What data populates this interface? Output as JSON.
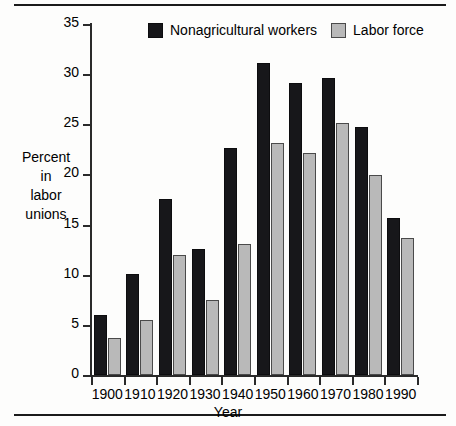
{
  "chart_data": {
    "type": "bar",
    "title": "",
    "xlabel": "Year",
    "ylabel": "Percent in labor unions",
    "ylabel_lines": [
      "Percent",
      "in",
      "labor",
      "unions"
    ],
    "categories": [
      "1900",
      "1910",
      "1920",
      "1930",
      "1940",
      "1950",
      "1960",
      "1970",
      "1980",
      "1990"
    ],
    "series": [
      {
        "name": "Nonagricultural workers",
        "color": "#17171a",
        "values": [
          6.0,
          10.1,
          17.6,
          12.6,
          22.6,
          31.1,
          29.1,
          29.6,
          24.7,
          15.7
        ]
      },
      {
        "name": "Labor force",
        "color": "#b9b9b9",
        "values": [
          3.7,
          5.5,
          12.0,
          7.5,
          13.1,
          23.1,
          22.1,
          25.1,
          19.9,
          13.7
        ]
      }
    ],
    "ylim": [
      0,
      35
    ],
    "yticks": [
      0,
      5,
      10,
      15,
      20,
      25,
      30,
      35
    ],
    "ytick_labels": [
      "0",
      "5",
      "10",
      "15",
      "20",
      "25",
      "30",
      "35"
    ],
    "grid": false,
    "legend_position": "top-center"
  },
  "legend": {
    "items": [
      {
        "label": "Nonagricultural workers",
        "swatch": "dark-swatch"
      },
      {
        "label": "Labor force",
        "swatch": "light-swatch"
      }
    ]
  }
}
